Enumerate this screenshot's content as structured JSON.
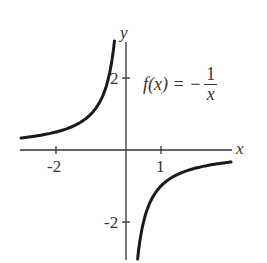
{
  "chart_data": {
    "type": "line",
    "title": "",
    "annotation": {
      "lhs": "f(x) = −",
      "numerator": "1",
      "denominator": "x"
    },
    "xlabel": "x",
    "ylabel": "y",
    "x_ticks": [
      {
        "value": -2,
        "label": "-2"
      },
      {
        "value": 1,
        "label": "1"
      }
    ],
    "y_ticks": [
      {
        "value": 2,
        "label": "2"
      },
      {
        "value": -2,
        "label": "-2"
      }
    ],
    "xlim": [
      -3,
      3.1
    ],
    "ylim": [
      -3,
      3
    ],
    "grid": false,
    "series": [
      {
        "name": "f(x) = -1/x, x<0",
        "x": [
          -3,
          -2,
          -1.5,
          -1,
          -0.75,
          -0.5,
          -0.4,
          -0.33
        ],
        "y": [
          0.33,
          0.5,
          0.67,
          1,
          1.33,
          2,
          2.5,
          3
        ]
      },
      {
        "name": "f(x) = -1/x, x>0",
        "x": [
          0.33,
          0.4,
          0.5,
          0.75,
          1,
          1.5,
          2,
          3
        ],
        "y": [
          -3,
          -2.5,
          -2,
          -1.33,
          -1,
          -0.67,
          -0.5,
          -0.33
        ]
      }
    ],
    "color": "#1a1a1a"
  }
}
